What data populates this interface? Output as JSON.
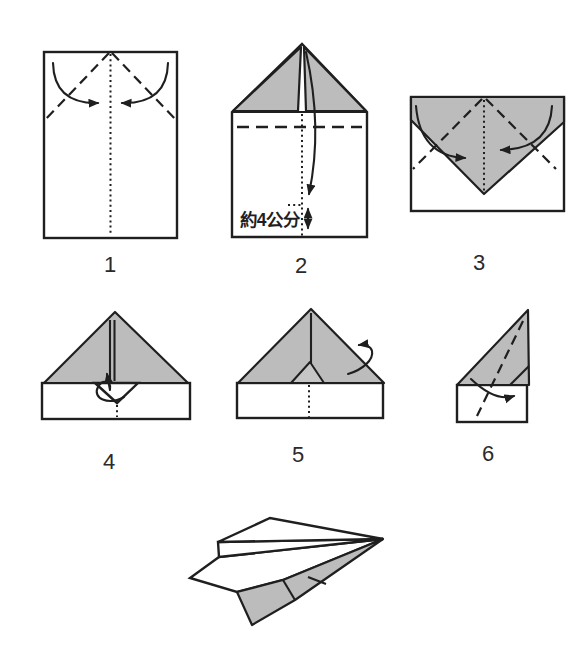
{
  "figure": {
    "colors": {
      "paper_white": "#ffffff",
      "shaded_gray": "#bcbcbc",
      "flap_gray": "#c6c6c6",
      "line_black": "#1f1f1f"
    }
  },
  "steps": [
    {
      "number": "1"
    },
    {
      "number": "2",
      "annotation": "約4公分"
    },
    {
      "number": "3"
    },
    {
      "number": "4"
    },
    {
      "number": "5"
    },
    {
      "number": "6"
    }
  ]
}
